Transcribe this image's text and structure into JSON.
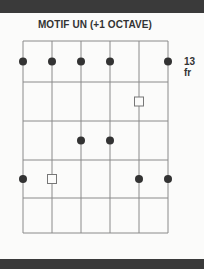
{
  "title": "MOTIF UN (+1 OCTAVE)",
  "fret_label": "13 fr",
  "diagram": {
    "strings": 6,
    "frets": 5,
    "string_x": [
      23,
      52,
      81,
      110,
      139,
      168
    ],
    "fret_y": [
      41,
      82,
      121,
      160,
      198,
      233
    ],
    "notes": [
      {
        "fret": 1,
        "string": 1,
        "type": "dot"
      },
      {
        "fret": 1,
        "string": 2,
        "type": "dot"
      },
      {
        "fret": 1,
        "string": 3,
        "type": "dot"
      },
      {
        "fret": 1,
        "string": 4,
        "type": "dot"
      },
      {
        "fret": 1,
        "string": 6,
        "type": "dot"
      },
      {
        "fret": 2,
        "string": 5,
        "type": "square"
      },
      {
        "fret": 3,
        "string": 3,
        "type": "dot"
      },
      {
        "fret": 3,
        "string": 4,
        "type": "dot"
      },
      {
        "fret": 4,
        "string": 1,
        "type": "dot"
      },
      {
        "fret": 4,
        "string": 2,
        "type": "square"
      },
      {
        "fret": 4,
        "string": 5,
        "type": "dot"
      },
      {
        "fret": 4,
        "string": 6,
        "type": "dot"
      }
    ],
    "colors": {
      "line": "#8a8a8a",
      "dot": "#333333",
      "square": "#777777"
    }
  }
}
